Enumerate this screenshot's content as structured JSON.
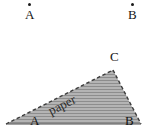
{
  "figure": {
    "background_color": "#ffffff",
    "width": 157,
    "height": 135
  },
  "top_points": [
    {
      "label": "A",
      "marker": "dot-marker",
      "x": 28,
      "y": 12
    },
    {
      "label": "B",
      "marker": "dot-marker",
      "x": 131,
      "y": 12
    }
  ],
  "paper_shape": {
    "fill_color": "#b0b0b0",
    "hatch_color": "#8a8a8a",
    "outline_color": "#3c3c3c",
    "label": "paper",
    "vertices": [
      {
        "name": "A",
        "x": 6,
        "y": 124
      },
      {
        "name": "B",
        "x": 141,
        "y": 124
      },
      {
        "name": "C",
        "x": 113,
        "y": 70
      }
    ],
    "edges": [
      {
        "from": "A",
        "to": "C",
        "style": "dashed"
      },
      {
        "from": "C",
        "to": "B",
        "style": "dashed"
      },
      {
        "from": "A",
        "to": "B",
        "style": "solid"
      }
    ]
  },
  "vertex_labels": [
    {
      "label": "C",
      "x": 110,
      "y": 57
    },
    {
      "label": "A",
      "x": 30,
      "y": 121
    },
    {
      "label": "B",
      "x": 125,
      "y": 121
    }
  ]
}
